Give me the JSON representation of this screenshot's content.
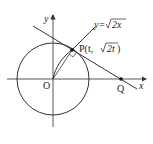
{
  "diagram": {
    "axes": {
      "x_label": "x",
      "y_label": "y",
      "origin_label": "O"
    },
    "curve_label": "y=√2x",
    "curve_label_prefix": "y=",
    "curve_label_sqrt": "2x",
    "point_p_label": "P(t, √2t )",
    "point_p_prefix": "P(t, ",
    "point_p_sqrt": "2t",
    "point_p_suffix": " )",
    "point_q_label": "Q",
    "elements": [
      "circle centered at O",
      "curve y=sqrt(2x)",
      "tangent line through P meeting x-axis at Q",
      "right-angle mark at P"
    ],
    "colors": {
      "stroke": "#333333",
      "background": "#ffffff"
    }
  }
}
